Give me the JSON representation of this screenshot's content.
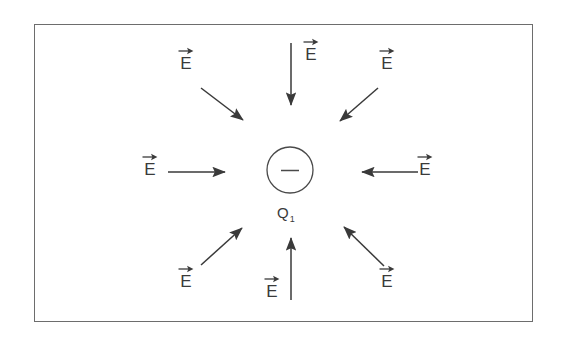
{
  "figure": {
    "title_visible": false,
    "background_color": "#ffffff",
    "stroke_color": "#3a3a3a",
    "frame": {
      "border_color": "#6d6d6d",
      "x": 34,
      "y": 24,
      "width": 499,
      "height": 298
    }
  },
  "charge": {
    "symbol": "−",
    "label_main": "Q",
    "label_sub": "1",
    "sign": "negative",
    "center_x": 290,
    "center_y": 170,
    "radius": 23,
    "outline_color": "#4a4a4a"
  },
  "vector_label": {
    "glyph": "E",
    "accent": "vector-arrow-overbar",
    "accent_icon": "right-arrow-icon"
  },
  "field_arrows": [
    {
      "id": "top-left",
      "direction": "down-right",
      "label_x": 178,
      "label_y": 47,
      "x1": 201,
      "y1": 88,
      "x2": 243,
      "y2": 120
    },
    {
      "id": "top-center",
      "direction": "down",
      "label_x": 303,
      "label_y": 38,
      "x1": 291,
      "y1": 43,
      "x2": 291,
      "y2": 105
    },
    {
      "id": "top-right",
      "direction": "down-left",
      "label_x": 379,
      "label_y": 47,
      "x1": 378,
      "y1": 88,
      "x2": 340,
      "y2": 121
    },
    {
      "id": "mid-left",
      "direction": "right",
      "label_x": 142,
      "label_y": 153,
      "x1": 168,
      "y1": 172,
      "x2": 225,
      "y2": 172
    },
    {
      "id": "mid-right",
      "direction": "left",
      "label_x": 417,
      "label_y": 153,
      "x1": 418,
      "y1": 172,
      "x2": 362,
      "y2": 172
    },
    {
      "id": "bottom-left",
      "direction": "up-right",
      "label_x": 178,
      "label_y": 265,
      "x1": 201,
      "y1": 265,
      "x2": 242,
      "y2": 228
    },
    {
      "id": "bottom-center",
      "direction": "up",
      "label_x": 264,
      "label_y": 275,
      "x1": 291,
      "y1": 300,
      "x2": 291,
      "y2": 238
    },
    {
      "id": "bottom-right",
      "direction": "up-left",
      "label_x": 379,
      "label_y": 265,
      "x1": 384,
      "y1": 266,
      "x2": 344,
      "y2": 227
    }
  ]
}
